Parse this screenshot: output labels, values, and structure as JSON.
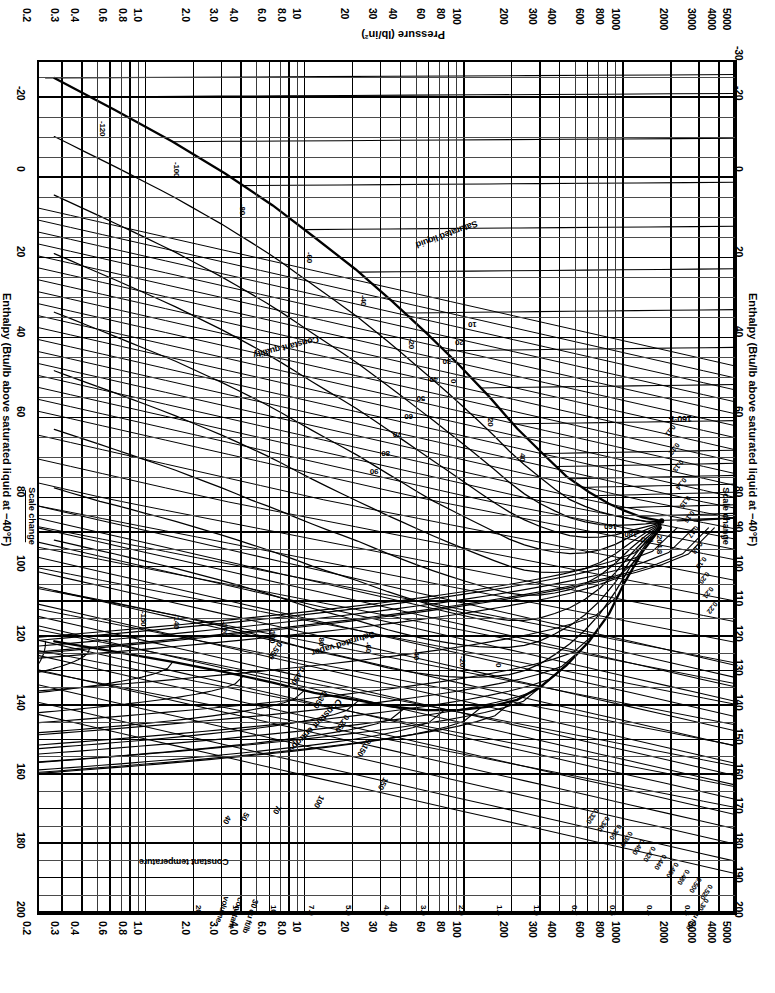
{
  "figure": {
    "kind": "pressure-enthalpy-diagram",
    "rotation_degrees": 180,
    "refrigerant_note": "Pressure-enthalpy (Mollier) chart"
  },
  "axes": {
    "pressure": {
      "title": "Pressure (lb/in²)",
      "unit": "lb/in²",
      "scale": "log",
      "ticks": [
        "5000",
        "4000",
        "3000",
        "2000",
        "1000",
        "800",
        "600",
        "400",
        "300",
        "200",
        "100",
        "80",
        "60",
        "40",
        "30",
        "20",
        "10",
        "8.0",
        "6.0",
        "4.0",
        "3.0",
        "2.0",
        "1.0",
        "0.8",
        "0.6",
        "0.4",
        "0.3",
        "0.2"
      ]
    },
    "enthalpy_left": {
      "title": "Enthalpy (Btu/lb above saturated liquid at −40°F)",
      "ticks": [
        "-30",
        "-20",
        "0",
        "20",
        "40",
        "60",
        "80",
        "90",
        "100",
        "110",
        "120",
        "130",
        "140",
        "150",
        "160",
        "170",
        "180",
        "190",
        "200"
      ]
    },
    "enthalpy_right": {
      "title": "Enthalpy (Btu/lb above saturated liquid at −40°F)",
      "ticks": [
        "-20",
        "0",
        "20",
        "40",
        "60",
        "80",
        "100",
        "120",
        "140",
        "160",
        "180",
        "200"
      ]
    },
    "scale_change_label": "Scale change"
  },
  "annotations": {
    "constant_temperature": "Constant temperature",
    "constant_volume": "30 cu ft/lb\nconstant\nvolume",
    "constant_volume_lines": [
      "30 cu ft/lb",
      "constant",
      "volume"
    ],
    "constant_entropy": "Constant entropy",
    "constant_quality": "Constant quality",
    "saturated_vapor": "Saturated vapor",
    "saturated_liquid": "Saturated liquid",
    "critical_temperature": "204.8",
    "low_temp_callout": "160°F",
    "small_volume_label": "0.30 cu ft/lb"
  },
  "chart_data": {
    "type": "line",
    "xlabel": "Enthalpy (Btu/lb above saturated liquid at −40°F)",
    "ylabel": "Pressure (lb/in²)",
    "grid": true,
    "yscale": "log",
    "xlim": [
      -30,
      200
    ],
    "ylim": [
      0.2,
      5000
    ],
    "x_ticks": [
      -30,
      -20,
      0,
      20,
      40,
      60,
      80,
      90,
      100,
      110,
      120,
      130,
      140,
      150,
      160,
      170,
      180,
      190,
      200
    ],
    "y_ticks": [
      0.2,
      0.3,
      0.4,
      0.6,
      0.8,
      1.0,
      2.0,
      3.0,
      4.0,
      6.0,
      8.0,
      10,
      20,
      30,
      40,
      60,
      80,
      100,
      200,
      300,
      400,
      600,
      800,
      1000,
      2000,
      3000,
      4000,
      5000
    ],
    "legend_position": "inline-labels",
    "series": [
      {
        "name": "Saturated liquid",
        "kind": "boundary",
        "points": [
          [
            -26,
            0.25
          ],
          [
            -18,
            0.6
          ],
          [
            -10,
            1.4
          ],
          [
            -2,
            3.0
          ],
          [
            6,
            6.0
          ],
          [
            14,
            11
          ],
          [
            22,
            20
          ],
          [
            30,
            34
          ],
          [
            38,
            56
          ],
          [
            46,
            90
          ],
          [
            54,
            140
          ],
          [
            62,
            210
          ],
          [
            68,
            300
          ],
          [
            74,
            430
          ],
          [
            78,
            600
          ],
          [
            81,
            800
          ],
          [
            83,
            1000
          ],
          [
            85,
            1300
          ],
          [
            86,
            1700
          ]
        ]
      },
      {
        "name": "Saturated vapor",
        "kind": "boundary",
        "points": [
          [
            121,
            0.25
          ],
          [
            124,
            0.6
          ],
          [
            127,
            1.4
          ],
          [
            130,
            3.0
          ],
          [
            133,
            6.0
          ],
          [
            136,
            11
          ],
          [
            138,
            20
          ],
          [
            140,
            34
          ],
          [
            141,
            56
          ],
          [
            141,
            90
          ],
          [
            140,
            140
          ],
          [
            138,
            210
          ],
          [
            134,
            300
          ],
          [
            128,
            430
          ],
          [
            121,
            600
          ],
          [
            113,
            800
          ],
          [
            104,
            1000
          ],
          [
            95,
            1300
          ],
          [
            88,
            1700
          ]
        ]
      },
      {
        "name": "Critical point",
        "kind": "point",
        "points": [
          [
            86,
            1720
          ]
        ],
        "label": "204.8"
      },
      {
        "name": "Constant temperature isotherms",
        "kind": "family",
        "values_degF": [
          -150,
          -140,
          -120,
          -100,
          -80,
          -60,
          -40,
          -20,
          0,
          20,
          40,
          50,
          60,
          70,
          80,
          100,
          120,
          140,
          160,
          180,
          200,
          204.8
        ],
        "unit": "°F"
      },
      {
        "name": "Constant quality",
        "kind": "family",
        "values_percent": [
          10,
          20,
          30,
          40,
          50,
          60,
          70,
          80,
          90
        ],
        "unit": "%"
      },
      {
        "name": "Constant volume",
        "kind": "family",
        "values_cuft_per_lb": [
          0.3,
          0.4,
          0.5,
          0.7,
          1.0,
          1.4,
          2.0,
          3.0,
          4.0,
          5.0,
          7.0,
          10,
          14,
          20,
          30,
          40
        ],
        "unit": "cu ft/lb"
      },
      {
        "name": "Constant entropy",
        "kind": "family",
        "values_btu_per_lb_R": [
          0.11,
          0.12,
          0.13,
          0.14,
          0.15,
          0.16,
          0.17,
          0.18,
          0.19,
          0.2,
          0.21,
          0.22,
          0.23,
          0.24,
          0.25,
          0.26,
          0.27,
          0.28,
          0.3,
          0.32,
          0.34,
          0.36,
          0.38,
          0.4,
          0.42,
          0.44,
          0.46,
          0.48,
          0.5,
          0.52
        ],
        "unit": "Btu/lb·°R"
      }
    ]
  },
  "inline_values": {
    "volume_top": [
      "0.30 cu ft/lb",
      "0.40",
      "0.50",
      "0.60",
      "0.80",
      "1.0",
      "1.4",
      "2",
      "3",
      "4",
      "5",
      "7",
      "10",
      "14",
      "20",
      "30",
      "40"
    ],
    "volume_markers": [
      "0.3",
      "0.4",
      "0.5",
      "0.7",
      "1.0",
      "1.4",
      "2.0",
      "3.0",
      "4.0",
      "5.0",
      "7.0",
      "10",
      "14",
      "20"
    ],
    "entropy_upper": [
      "0.520",
      "0.500",
      "0.480",
      "0.460",
      "0.440",
      "0.420",
      "0.400",
      "0.380",
      "0.360",
      "0.340",
      "0.320"
    ],
    "entropy_mid": [
      "0.150",
      "0.250",
      "0.350",
      "0.450",
      "0.550"
    ],
    "entropy_lower": [
      "0.11",
      "0.12",
      "0.13",
      "0.14",
      "0.15",
      "0.16",
      "0.17",
      "0.18",
      "0.19",
      "0.20",
      "0.21",
      "0.22"
    ],
    "temperature_sat": [
      "-120",
      "-100",
      "-80",
      "-60",
      "-40",
      "-20",
      "0",
      "20",
      "40",
      "60",
      "80",
      "100",
      "120",
      "140",
      "160",
      "180",
      "200",
      "204.8"
    ],
    "temperature_super": [
      "-150",
      "-140",
      "-120",
      "-100",
      "-80",
      "-60",
      "-40",
      "-20",
      "0",
      "20",
      "40",
      "50",
      "60",
      "70",
      "100",
      "150"
    ],
    "quality": [
      "10",
      "20",
      "30",
      "40",
      "50",
      "60",
      "70",
      "80",
      "90"
    ]
  }
}
